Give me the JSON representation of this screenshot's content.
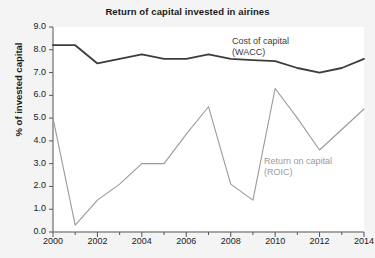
{
  "chart_data": {
    "type": "line",
    "title": "Return of capital invested in airines",
    "xlabel": "",
    "ylabel": "% of invested capital",
    "xlim": [
      2000,
      2014
    ],
    "ylim": [
      0.0,
      9.0
    ],
    "grid": false,
    "legend_position": "inline-annotation",
    "x": [
      2000,
      2001,
      2002,
      2003,
      2004,
      2005,
      2006,
      2007,
      2008,
      2009,
      2010,
      2011,
      2012,
      2013,
      2014
    ],
    "xticks": [
      2000,
      2002,
      2004,
      2006,
      2008,
      2010,
      2012,
      2014
    ],
    "xticklabels": [
      "2000",
      "2002",
      "2004",
      "2006",
      "2008",
      "2010",
      "2012",
      "2014"
    ],
    "yticks": [
      0.0,
      1.0,
      2.0,
      3.0,
      4.0,
      5.0,
      6.0,
      7.0,
      8.0,
      9.0
    ],
    "yticklabels": [
      "0.0",
      "1.0",
      "2.0",
      "3.0",
      "4.0",
      "5.0",
      "6.0",
      "7.0",
      "8.0",
      "9.0"
    ],
    "series": [
      {
        "name": "Cost of capital (WACC)",
        "color": "#3c3c3c",
        "values": [
          8.2,
          8.2,
          7.4,
          7.6,
          7.8,
          7.6,
          7.6,
          7.8,
          7.6,
          7.55,
          7.5,
          7.2,
          7.0,
          7.2,
          7.6
        ]
      },
      {
        "name": "Return on capital (ROIC)",
        "color": "#9a9a9a",
        "values": [
          5.0,
          0.3,
          1.4,
          2.1,
          3.0,
          3.0,
          4.3,
          5.5,
          2.1,
          1.4,
          6.3,
          5.0,
          3.6,
          4.5,
          5.4
        ]
      }
    ],
    "annotations": [
      {
        "text_line1": "Cost of capital",
        "text_line2": "(WACC)",
        "color": "#3a3a3a"
      },
      {
        "text_line1": "Return on capital",
        "text_line2": "(ROIC)",
        "color": "#9a9a9a"
      }
    ]
  }
}
